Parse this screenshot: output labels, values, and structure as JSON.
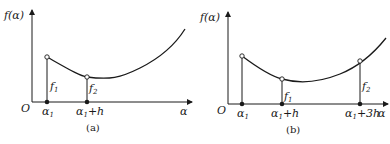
{
  "figures": [
    {
      "id": "a",
      "caption": "(a)",
      "y_axis_label": "f(α)",
      "x_axis_label": "α",
      "origin_label": "O",
      "x_points": [
        {
          "label": "α₁",
          "base": "α",
          "sub": "1",
          "suffix": ""
        },
        {
          "label": "α₁+h",
          "base": "α",
          "sub": "1",
          "suffix": "+h"
        }
      ],
      "value_labels": [
        {
          "label": "f₁",
          "base": "f",
          "sub": "1"
        },
        {
          "label": "f₂",
          "base": "f",
          "sub": "2"
        }
      ]
    },
    {
      "id": "b",
      "caption": "(b)",
      "y_axis_label": "f(α)",
      "x_axis_label": "α",
      "origin_label": "O",
      "x_points": [
        {
          "label": "α₁",
          "base": "α",
          "sub": "1",
          "suffix": ""
        },
        {
          "label": "α₁+h",
          "base": "α",
          "sub": "1",
          "suffix": "+h"
        },
        {
          "label": "α₁+3h",
          "base": "α",
          "sub": "1",
          "suffix": "+3h"
        }
      ],
      "value_labels": [
        {
          "label": "f₁",
          "base": "f",
          "sub": "1"
        },
        {
          "label": "f₂",
          "base": "f",
          "sub": "2"
        }
      ]
    }
  ],
  "colors": {
    "stroke": "#1a1a1a",
    "background": "#ffffff"
  }
}
